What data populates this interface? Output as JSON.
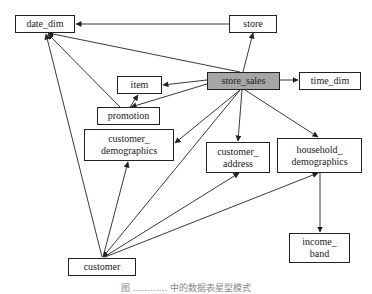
{
  "diagram": {
    "nodes": [
      {
        "id": "date_dim",
        "label": "date_dim",
        "x": 15,
        "y": 15,
        "w": 60,
        "h": 18,
        "fact": false
      },
      {
        "id": "store",
        "label": "store",
        "x": 229,
        "y": 15,
        "w": 48,
        "h": 18,
        "fact": false
      },
      {
        "id": "item",
        "label": "item",
        "x": 117,
        "y": 76,
        "w": 45,
        "h": 18,
        "fact": false
      },
      {
        "id": "store_sales",
        "label": "store_sales",
        "x": 207,
        "y": 72,
        "w": 73,
        "h": 18,
        "fact": true
      },
      {
        "id": "time_dim",
        "label": "time_dim",
        "x": 299,
        "y": 72,
        "w": 62,
        "h": 18,
        "fact": false
      },
      {
        "id": "promotion",
        "label": "promotion",
        "x": 97,
        "y": 107,
        "w": 63,
        "h": 18,
        "fact": false
      },
      {
        "id": "customer_demographics",
        "label": "customer_\ndemographics",
        "x": 84,
        "y": 129,
        "w": 90,
        "h": 32,
        "fact": false
      },
      {
        "id": "customer_address",
        "label": "customer_\naddress",
        "x": 206,
        "y": 142,
        "w": 64,
        "h": 31,
        "fact": false
      },
      {
        "id": "household_demographics",
        "label": "household_\ndemographics",
        "x": 277,
        "y": 138,
        "w": 85,
        "h": 35,
        "fact": false
      },
      {
        "id": "income_band",
        "label": "income_\nband",
        "x": 289,
        "y": 233,
        "w": 61,
        "h": 30,
        "fact": false
      },
      {
        "id": "customer",
        "label": "customer",
        "x": 68,
        "y": 258,
        "w": 68,
        "h": 18,
        "fact": false
      }
    ],
    "edges": [
      {
        "from": "store",
        "to": "date_dim",
        "x1": 229,
        "y1": 24,
        "x2": 76,
        "y2": 24
      },
      {
        "from": "store_sales",
        "to": "date_dim",
        "x1": 240,
        "y1": 72,
        "x2": 48,
        "y2": 33
      },
      {
        "from": "store_sales",
        "to": "store",
        "x1": 243,
        "y1": 72,
        "x2": 253,
        "y2": 33
      },
      {
        "from": "store_sales",
        "to": "item",
        "x1": 207,
        "y1": 80,
        "x2": 163,
        "y2": 85
      },
      {
        "from": "store_sales",
        "to": "time_dim",
        "x1": 280,
        "y1": 80,
        "x2": 298,
        "y2": 80
      },
      {
        "from": "store_sales",
        "to": "promotion",
        "x1": 207,
        "y1": 84,
        "x2": 131,
        "y2": 107
      },
      {
        "from": "store_sales",
        "to": "customer_demographics",
        "x1": 240,
        "y1": 90,
        "x2": 175,
        "y2": 143
      },
      {
        "from": "store_sales",
        "to": "customer_address",
        "x1": 242,
        "y1": 90,
        "x2": 238,
        "y2": 141
      },
      {
        "from": "store_sales",
        "to": "household_demographics",
        "x1": 245,
        "y1": 90,
        "x2": 318,
        "y2": 137
      },
      {
        "from": "store_sales",
        "to": "customer",
        "x1": 240,
        "y1": 90,
        "x2": 103,
        "y2": 257
      },
      {
        "from": "promotion",
        "to": "date_dim",
        "x1": 120,
        "y1": 107,
        "x2": 48,
        "y2": 34
      },
      {
        "from": "promotion",
        "to": "item",
        "x1": 130,
        "y1": 107,
        "x2": 138,
        "y2": 95
      },
      {
        "from": "customer",
        "to": "date_dim",
        "x1": 102,
        "y1": 257,
        "x2": 46,
        "y2": 34
      },
      {
        "from": "customer",
        "to": "customer_demographics",
        "x1": 103,
        "y1": 257,
        "x2": 128,
        "y2": 162
      },
      {
        "from": "customer",
        "to": "customer_address",
        "x1": 104,
        "y1": 257,
        "x2": 239,
        "y2": 173
      },
      {
        "from": "customer",
        "to": "household_demographics",
        "x1": 105,
        "y1": 257,
        "x2": 318,
        "y2": 173
      },
      {
        "from": "household_demographics",
        "to": "income_band",
        "x1": 320,
        "y1": 173,
        "x2": 320,
        "y2": 232
      }
    ]
  },
  "caption": "图 ............ 中的数据表星型模式",
  "colors": {
    "stroke": "#222222",
    "fact_fill": "#a6a6a6",
    "dimension_fill": "#ffffff",
    "caption": "#888888"
  }
}
